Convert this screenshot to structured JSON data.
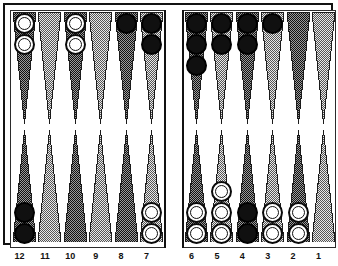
{
  "board": {
    "title": "Backgammon board position",
    "colors": {
      "frame": "#111111",
      "surface": "#ffffff",
      "point_dark": "#4a4a4a",
      "point_light": "#bdbdbd",
      "checker_white": "#ffffff",
      "checker_black": "#101010",
      "label_text": "#111111"
    },
    "bar": {
      "checkers": []
    },
    "point_labels": {
      "bottom_left": [
        "12",
        "11",
        "10",
        "9",
        "8",
        "7"
      ],
      "bottom_right": [
        "6",
        "5",
        "4",
        "3",
        "2",
        "1"
      ],
      "top_left": [
        "",
        "",
        "",
        "",
        "",
        ""
      ],
      "top_right": [
        "",
        "",
        "",
        "",
        "",
        ""
      ]
    },
    "quadrants": {
      "top_left": [
        {
          "index": 0,
          "shade": "dark",
          "checker_color": "white",
          "count": 2
        },
        {
          "index": 1,
          "shade": "light",
          "checker_color": "none",
          "count": 0
        },
        {
          "index": 2,
          "shade": "dark",
          "checker_color": "white",
          "count": 2
        },
        {
          "index": 3,
          "shade": "light",
          "checker_color": "none",
          "count": 0
        },
        {
          "index": 4,
          "shade": "dark",
          "checker_color": "black",
          "count": 1
        },
        {
          "index": 5,
          "shade": "light",
          "checker_color": "black",
          "count": 2
        }
      ],
      "top_right": [
        {
          "index": 0,
          "shade": "dark",
          "checker_color": "black",
          "count": 3
        },
        {
          "index": 1,
          "shade": "light",
          "checker_color": "black",
          "count": 2
        },
        {
          "index": 2,
          "shade": "dark",
          "checker_color": "black",
          "count": 2
        },
        {
          "index": 3,
          "shade": "light",
          "checker_color": "black",
          "count": 1
        },
        {
          "index": 4,
          "shade": "dark",
          "checker_color": "none",
          "count": 0
        },
        {
          "index": 5,
          "shade": "light",
          "checker_color": "none",
          "count": 0
        }
      ],
      "bottom_left": [
        {
          "index": 0,
          "shade": "dark",
          "checker_color": "black",
          "count": 2
        },
        {
          "index": 1,
          "shade": "light",
          "checker_color": "none",
          "count": 0
        },
        {
          "index": 2,
          "shade": "dark",
          "checker_color": "none",
          "count": 0
        },
        {
          "index": 3,
          "shade": "light",
          "checker_color": "none",
          "count": 0
        },
        {
          "index": 4,
          "shade": "dark",
          "checker_color": "none",
          "count": 0
        },
        {
          "index": 5,
          "shade": "light",
          "checker_color": "white",
          "count": 2
        }
      ],
      "bottom_right": [
        {
          "index": 0,
          "shade": "dark",
          "checker_color": "white",
          "count": 2
        },
        {
          "index": 1,
          "shade": "light",
          "checker_color": "white",
          "count": 3
        },
        {
          "index": 2,
          "shade": "dark",
          "checker_color": "black",
          "count": 2
        },
        {
          "index": 3,
          "shade": "light",
          "checker_color": "white",
          "count": 2
        },
        {
          "index": 4,
          "shade": "dark",
          "checker_color": "white",
          "count": 2
        },
        {
          "index": 5,
          "shade": "light",
          "checker_color": "none",
          "count": 0
        }
      ]
    }
  }
}
